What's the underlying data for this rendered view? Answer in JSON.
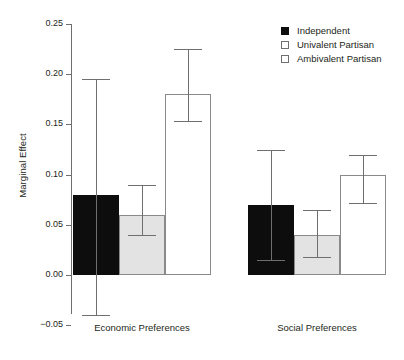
{
  "chart_data": {
    "type": "bar",
    "title": "",
    "xlabel": "",
    "ylabel": "Marginal Effect",
    "categories": [
      "Economic Preferences",
      "Social Preferences"
    ],
    "ylim": [
      -0.05,
      0.25
    ],
    "yticks": [
      0.25,
      0.2,
      0.15,
      0.1,
      0.05,
      0.0,
      -0.05
    ],
    "ytick_labels": [
      "0.25",
      "0.20",
      "0.15",
      "0.10",
      "0.05",
      "0.00",
      "−0.05"
    ],
    "grid": false,
    "legend_position": "top-right",
    "error_bars": "confidence-interval",
    "series": [
      {
        "name": "Independent",
        "fill": "#0d0d0d",
        "values": [
          0.08,
          0.07
        ],
        "ci_low": [
          -0.04,
          0.015
        ],
        "ci_high": [
          0.195,
          0.125
        ]
      },
      {
        "name": "Univalent Partisan",
        "fill": "#e3e3e3",
        "values": [
          0.06,
          0.04
        ],
        "ci_low": [
          0.04,
          0.018
        ],
        "ci_high": [
          0.09,
          0.065
        ]
      },
      {
        "name": "Ambivalent Partisan",
        "fill": "#ffffff",
        "values": [
          0.18,
          0.1
        ],
        "ci_low": [
          0.153,
          0.072
        ],
        "ci_high": [
          0.225,
          0.12
        ]
      }
    ]
  },
  "legend": {
    "items": [
      {
        "label": "Independent",
        "swatch": "filled"
      },
      {
        "label": "Univalent Partisan",
        "swatch": "open"
      },
      {
        "label": "Ambivalent Partisan",
        "swatch": "open"
      }
    ]
  }
}
